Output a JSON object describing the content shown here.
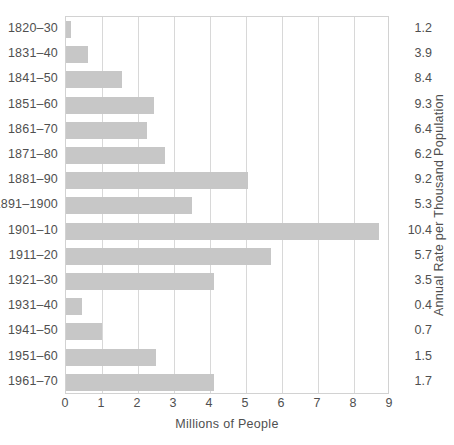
{
  "chart_data": {
    "type": "bar",
    "orientation": "horizontal",
    "title": "",
    "xlabel": "Millions of People",
    "ylabel": "",
    "right_axis_label": "Annual Rate per Thousand Population",
    "xlim": [
      0,
      9
    ],
    "xticks": [
      "0",
      "1",
      "2",
      "3",
      "4",
      "5",
      "6",
      "7",
      "8",
      "9"
    ],
    "grid": true,
    "legend": "none",
    "bar_color": "#c7c7c7",
    "categories": [
      "1820–30",
      "1831–40",
      "1841–50",
      "1851–60",
      "1861–70",
      "1871–80",
      "1881–90",
      "1891–1900",
      "1901–10",
      "1911–20",
      "1921–30",
      "1931–40",
      "1941–50",
      "1951–60",
      "1961–70"
    ],
    "series": [
      {
        "name": "Millions of People",
        "values": [
          0.15,
          0.6,
          1.55,
          2.45,
          2.25,
          2.75,
          5.05,
          3.5,
          8.7,
          5.7,
          4.1,
          0.45,
          1.0,
          2.5,
          4.1
        ]
      }
    ],
    "rate_values": [
      "1.2",
      "3.9",
      "8.4",
      "9.3",
      "6.4",
      "6.2",
      "9.2",
      "5.3",
      "10.4",
      "5.7",
      "3.5",
      "0.4",
      "0.7",
      "1.5",
      "1.7"
    ]
  }
}
